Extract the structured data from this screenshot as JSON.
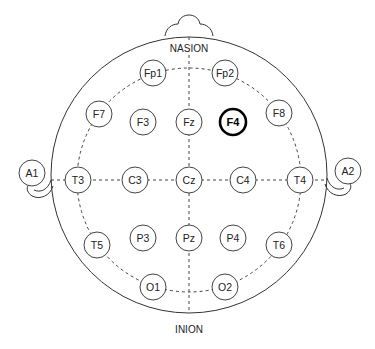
{
  "landmarks": {
    "nasion": "NASION",
    "inion": "INION"
  },
  "highlighted_electrode": "F4",
  "colors": {
    "stroke": "#444444",
    "highlight_stroke": "#000000",
    "background": "#ffffff"
  },
  "electrodes": {
    "fp1": "Fp1",
    "fp2": "Fp2",
    "f7": "F7",
    "f3": "F3",
    "fz": "Fz",
    "f4": "F4",
    "f8": "F8",
    "a1": "A1",
    "t3": "T3",
    "c3": "C3",
    "cz": "Cz",
    "c4": "C4",
    "t4": "T4",
    "a2": "A2",
    "t5": "T5",
    "p3": "P3",
    "pz": "Pz",
    "p4": "P4",
    "t6": "T6",
    "o1": "O1",
    "o2": "O2"
  }
}
